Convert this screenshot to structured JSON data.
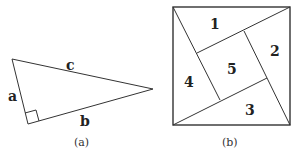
{
  "figure_a": {
    "caption": "(a)",
    "labels": {
      "a": "a",
      "b": "b",
      "c": "c"
    }
  },
  "figure_b": {
    "caption": "(b)",
    "regions": [
      "1",
      "2",
      "3",
      "4",
      "5"
    ]
  }
}
